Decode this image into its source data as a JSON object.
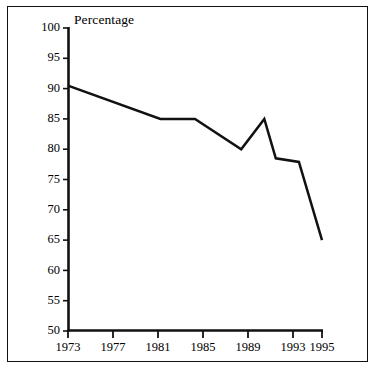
{
  "chart_data": {
    "type": "line",
    "title": "Percentage",
    "xlabel": "",
    "ylabel": "Percentage",
    "ylim": [
      50,
      100
    ],
    "xlim": [
      1973,
      1995
    ],
    "grid": false,
    "legend": false,
    "yticks": [
      100,
      95,
      90,
      85,
      80,
      75,
      70,
      65,
      60,
      55,
      50
    ],
    "xticks": [
      1973,
      1977,
      1981,
      1985,
      1989,
      1993,
      1995
    ],
    "x": [
      1973,
      1981,
      1984,
      1988,
      1990,
      1991,
      1993,
      1995
    ],
    "values": [
      90.5,
      85.0,
      85.0,
      80.0,
      85.0,
      78.5,
      77.9,
      65.0
    ],
    "series": [
      {
        "name": "Percentage",
        "color": "#111111",
        "points": [
          {
            "x": 1973,
            "y": 90.5
          },
          {
            "x": 1981,
            "y": 85.0
          },
          {
            "x": 1984,
            "y": 85.0
          },
          {
            "x": 1988,
            "y": 80.0
          },
          {
            "x": 1990,
            "y": 85.0
          },
          {
            "x": 1991,
            "y": 78.5
          },
          {
            "x": 1993,
            "y": 77.9
          },
          {
            "x": 1995,
            "y": 65.0
          }
        ]
      }
    ]
  },
  "axes": {
    "y_labels": [
      "100",
      "95",
      "90",
      "85",
      "80",
      "75",
      "70",
      "65",
      "60",
      "55",
      "50"
    ],
    "x_labels": [
      "1973",
      "1977",
      "1981",
      "1985",
      "1989",
      "1993",
      "1995"
    ],
    "title": "Percentage"
  },
  "style": {
    "line_color": "#111111",
    "axis_color": "#111111",
    "frame_color": "#111111",
    "background": "#ffffff"
  }
}
